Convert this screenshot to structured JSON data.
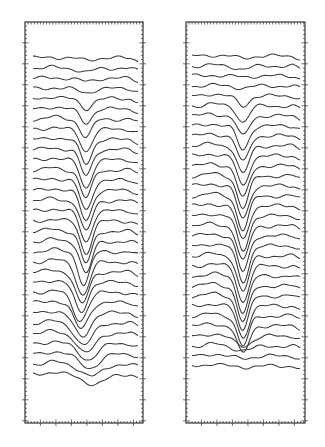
{
  "chart_data": {
    "type": "line",
    "title": "",
    "xlabel": "",
    "ylabel": "",
    "grid": false,
    "legend": null,
    "panels": [
      {
        "name": "left-panel",
        "frame": {
          "x": 25,
          "y": 22,
          "w": 118,
          "h": 401
        },
        "trace_x_start": 33,
        "trace_x_end": 138,
        "dip_center_x": 86,
        "first_trace_y": 58,
        "trace_spacing": 10.2,
        "trace_count": 32,
        "dip_depths": [
          2,
          4,
          3,
          4,
          10,
          14,
          18,
          22,
          24,
          26,
          28,
          28,
          30,
          30,
          31,
          31,
          32,
          32,
          32,
          33,
          33,
          32,
          30,
          28,
          26,
          24,
          22,
          20,
          16,
          14,
          12,
          10
        ],
        "dip_shift": [
          0,
          0,
          0,
          0,
          0,
          0,
          0,
          0,
          0,
          0,
          0,
          0,
          0,
          0,
          0,
          0,
          0,
          0,
          0,
          -2,
          -3,
          -4,
          -5,
          -6,
          -5,
          -4,
          -2,
          0,
          2,
          4,
          6,
          8
        ],
        "dip_width": [
          10,
          10,
          10,
          10,
          8,
          8,
          8,
          8,
          8,
          8,
          8,
          8,
          8,
          8,
          8,
          8,
          8,
          8,
          8,
          8,
          9,
          9,
          9,
          10,
          10,
          11,
          12,
          12,
          13,
          14,
          15,
          16
        ]
      },
      {
        "name": "right-panel",
        "frame": {
          "x": 186,
          "y": 22,
          "w": 119,
          "h": 401
        },
        "trace_x_start": 192,
        "trace_x_end": 301,
        "dip_center_x": 243,
        "first_trace_y": 56,
        "trace_spacing": 10.0,
        "trace_count": 32,
        "dip_depths": [
          2,
          3,
          1,
          2,
          10,
          16,
          20,
          24,
          26,
          28,
          30,
          32,
          32,
          33,
          34,
          34,
          35,
          35,
          36,
          36,
          36,
          36,
          36,
          36,
          34,
          32,
          30,
          28,
          10,
          4,
          2,
          1
        ],
        "dip_shift": [
          0,
          0,
          0,
          0,
          0,
          0,
          0,
          0,
          0,
          0,
          0,
          0,
          0,
          0,
          0,
          0,
          0,
          0,
          0,
          0,
          0,
          0,
          0,
          0,
          0,
          0,
          0,
          0,
          0,
          0,
          0,
          0
        ],
        "dip_width": [
          10,
          10,
          10,
          10,
          8,
          8,
          8,
          8,
          8,
          8,
          8,
          8,
          8,
          8,
          8,
          8,
          8,
          8,
          8,
          8,
          8,
          8,
          8,
          8,
          8,
          8,
          8,
          8,
          12,
          14,
          14,
          14
        ]
      }
    ],
    "colors": {
      "line": "#3a3a3a",
      "frame": "#222222",
      "background": "#ffffff"
    }
  }
}
